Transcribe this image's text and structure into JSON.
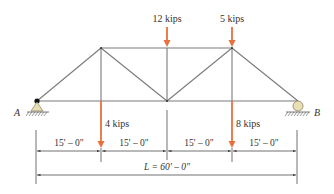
{
  "diagram": {
    "type": "truss",
    "colors": {
      "member": "#7a7a7a",
      "load": "#e8703a",
      "support_fill": "#e9dfb4",
      "node": "#111111",
      "dimension": "#333333"
    },
    "supports": {
      "left": {
        "label": "A",
        "type": "pin"
      },
      "right": {
        "label": "B",
        "type": "roller"
      }
    },
    "loads": [
      {
        "id": "top-left-load",
        "label": "12 kips",
        "location": "top chord, midspan"
      },
      {
        "id": "top-right-load",
        "label": "5 kips",
        "location": "top chord, 45 ft"
      },
      {
        "id": "bottom-left-load",
        "label": "4 kips",
        "location": "bottom chord, 15 ft"
      },
      {
        "id": "bottom-right-load",
        "label": "8 kips",
        "location": "bottom chord, 45 ft"
      }
    ],
    "dimensions": {
      "panels": [
        "15' – 0\"",
        "15' – 0\"",
        "15' – 0\"",
        "15' – 0\""
      ],
      "total": "L = 60' – 0\""
    }
  }
}
